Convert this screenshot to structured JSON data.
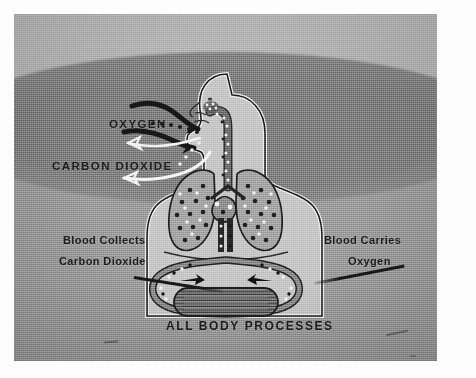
{
  "image": {
    "kind": "photograph-of-illustration",
    "subject": "human respiration and circulation diagram",
    "border_color": "#fdfdfd",
    "plate": {
      "background_light": "#b9b9b9",
      "background_mid": "#9b9b9b",
      "background_dark": "#7e7e7e"
    }
  },
  "labels": {
    "oxygen": "OXYGEN",
    "carbon_dioxide": "CARBON  DIOXIDE",
    "blood_collects": "Blood  Collects",
    "carbon_dioxide_2": "Carbon  Dioxide",
    "blood_carries": "Blood  Carries",
    "oxygen_2": "Oxygen",
    "all_body_processes": "ALL BODY  PROCESSES"
  },
  "colors": {
    "text": "#1c1c1c",
    "oxygen_arrow": "#1a1a1a",
    "co2_arrow": "#f2f2f2",
    "body_outline": "#1b1b1b",
    "body_fill": "#c9c9c9",
    "lung_fill": "#a6a6a6",
    "vessel_dark": "#2b2b2b",
    "vessel_light": "#ededed",
    "leader_line": "#181818"
  },
  "figure_parts": {
    "head": "profile head facing left",
    "trachea": "windpipe with oxygen dots descending",
    "lungs": "pair of lungs speckled with dark and light dots",
    "heart": "central heart between the lungs",
    "vessel_loop": "circulatory loop below the lungs",
    "body_processes_organ": "textured organ labelled ALL BODY PROCESSES",
    "oxygen_arrows": "two dark arrows flowing right into the nose",
    "co2_arrows": "two white outlined arrows flowing left away from the nose",
    "dotted_trail": "dotted oxygen particle trail entering the nose"
  }
}
